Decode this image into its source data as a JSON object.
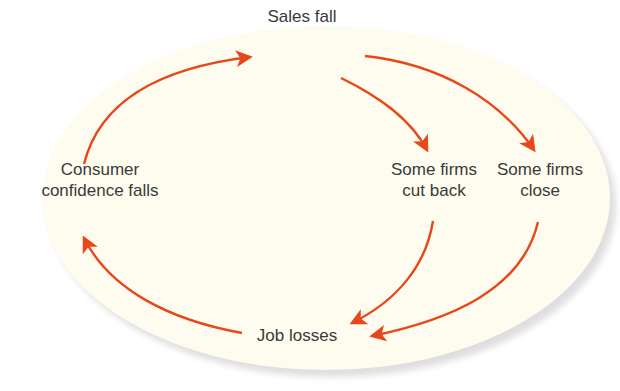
{
  "diagram": {
    "type": "cycle",
    "background_color": "#fdfcee",
    "shadow_color": "#d9d9dc",
    "arrow_color": "#e8471c",
    "text_color": "#3a3a3a",
    "nodes": [
      {
        "id": "sales",
        "label": "Sales fall"
      },
      {
        "id": "cutback",
        "label_line1": "Some firms",
        "label_line2": "cut back"
      },
      {
        "id": "close",
        "label_line1": "Some firms",
        "label_line2": "close"
      },
      {
        "id": "jobs",
        "label": "Job losses"
      },
      {
        "id": "confidence",
        "label_line1": "Consumer",
        "label_line2": "confidence falls"
      }
    ],
    "edges": [
      {
        "from": "confidence",
        "to": "sales"
      },
      {
        "from": "sales",
        "to": "cutback"
      },
      {
        "from": "sales",
        "to": "close"
      },
      {
        "from": "cutback",
        "to": "jobs"
      },
      {
        "from": "close",
        "to": "jobs"
      },
      {
        "from": "jobs",
        "to": "confidence"
      }
    ]
  }
}
